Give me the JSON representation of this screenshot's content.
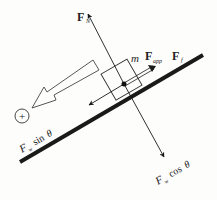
{
  "diagram": {
    "colors": {
      "line": "#1a1a1a",
      "background": "#fdfdfb"
    },
    "labels": {
      "normal_force": {
        "main": "F",
        "sub": "N"
      },
      "applied_force": {
        "mass": "m",
        "main": "F",
        "sub": "app"
      },
      "friction_force": {
        "main": "F",
        "sub": "f"
      },
      "weight_parallel": {
        "main": "F",
        "sub": "w",
        "trig": "sin",
        "angle": "θ"
      },
      "weight_perpendicular": {
        "main": "F",
        "sub": "w",
        "trig": "cos",
        "angle": "θ"
      },
      "positive_direction_symbol": "+"
    }
  }
}
